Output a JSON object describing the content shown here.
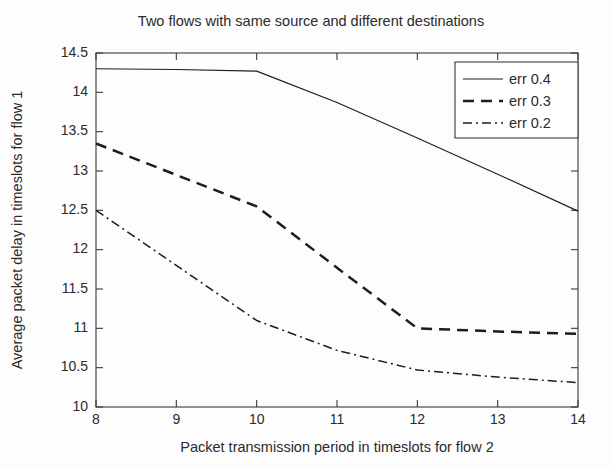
{
  "chart_data": {
    "type": "line",
    "title": "Two flows with same source and different destinations",
    "xlabel": "Packet transmission period in timeslots for flow 2",
    "ylabel": "Average packet delay in timeslots for flow 1",
    "xlim": [
      8,
      14
    ],
    "ylim": [
      10,
      14.5
    ],
    "xticks": [
      8,
      9,
      10,
      11,
      12,
      13,
      14
    ],
    "xticklabels": [
      "8",
      "9",
      "10",
      "11",
      "12",
      "13",
      "14"
    ],
    "yticks": [
      10,
      10.5,
      11,
      11.5,
      12,
      12.5,
      13,
      13.5,
      14,
      14.5
    ],
    "yticklabels": [
      "10",
      "10.5",
      "11",
      "11.5",
      "12",
      "12.5",
      "13",
      "13.5",
      "14",
      "14.5"
    ],
    "grid": false,
    "legend_position": "upper right",
    "x": [
      8,
      9,
      10,
      11,
      12,
      13,
      14
    ],
    "series": [
      {
        "name": "err 0.4",
        "style": "solid",
        "values": [
          14.3,
          14.29,
          14.27,
          13.87,
          13.42,
          12.96,
          12.49
        ]
      },
      {
        "name": "err 0.3",
        "style": "dashed",
        "values": [
          13.35,
          12.95,
          12.55,
          11.77,
          11.0,
          10.96,
          10.93
        ]
      },
      {
        "name": "err 0.2",
        "style": "dashdot",
        "values": [
          12.5,
          11.8,
          11.1,
          10.72,
          10.47,
          10.38,
          10.31
        ]
      }
    ]
  },
  "legend": {
    "entries": [
      {
        "label": "err 0.4",
        "style": "solid"
      },
      {
        "label": "err 0.3",
        "style": "dashed"
      },
      {
        "label": "err 0.2",
        "style": "dashdot"
      }
    ]
  },
  "colors": {
    "axis": "#3a3a3a",
    "line": "#1d1d1d",
    "text": "#2b2b2b",
    "background": "#fdfdfd"
  }
}
